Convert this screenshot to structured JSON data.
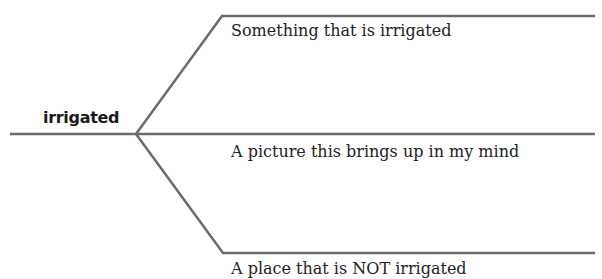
{
  "diagram": {
    "type": "word-map",
    "center_word": "irrigated",
    "branches": [
      {
        "label": "Something that is irrigated"
      },
      {
        "label": "A picture this brings up in my mind"
      },
      {
        "label": "A place that is NOT irrigated"
      }
    ],
    "line_color": "#6b6b6b"
  }
}
